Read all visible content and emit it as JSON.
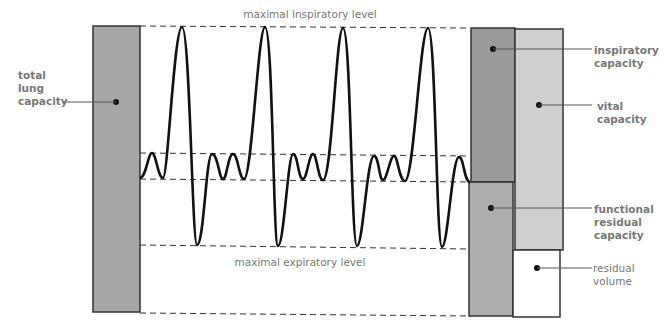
{
  "levels": {
    "max_inspiratory": "maximal inspiratory level",
    "max_expiratory": "maximal expiratory level"
  },
  "labels": {
    "total_lung_capacity": [
      "total",
      "lung",
      "capacity"
    ],
    "inspiratory_capacity": [
      "inspiratory",
      "capacity"
    ],
    "vital_capacity": [
      "vital",
      "capacity"
    ],
    "functional_residual_capacity": [
      "functional",
      "residual",
      "capacity"
    ],
    "residual_volume": [
      "residual",
      "volume"
    ]
  },
  "colors": {
    "total_lung_capacity": "#a6a6a6",
    "inspiratory_capacity": "#9a9a9a",
    "vital_capacity": "#cfcfcf",
    "functional_residual_capacity": "#adadad",
    "residual_volume": "#ffffff",
    "label_text": "#777777"
  }
}
